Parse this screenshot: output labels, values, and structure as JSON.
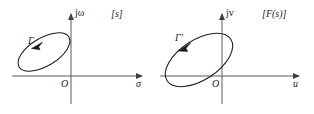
{
  "figure": {
    "background_color": "#ffffff",
    "line_color": "#1a1a1a",
    "axis_color": "#4a4a4a",
    "panels": [
      {
        "id": "s-plane",
        "plane_label": "[s]",
        "vertical_axis_label": "jω",
        "horizontal_axis_label": "σ",
        "origin_label": "O",
        "contour_label": "Γ",
        "contour_direction": "counterclockwise",
        "contour_shape": "tilted-ellipse",
        "contour_tilt_deg": -31,
        "contour_center_x": 44,
        "contour_center_y": 52,
        "contour_rx": 29,
        "contour_ry": 14,
        "axis_origin_x": 71,
        "axis_origin_y": 76,
        "h_axis_start_x": 12,
        "h_axis_end_x": 146,
        "v_axis_top_y": 11,
        "v_axis_bottom_y": 104
      },
      {
        "id": "F-plane",
        "plane_label": "[F(s)]",
        "vertical_axis_label": "jv",
        "horizontal_axis_label": "u",
        "origin_label": "O",
        "contour_label": "Γ'",
        "contour_direction": "counterclockwise",
        "contour_shape": "tilted-ellipse",
        "contour_tilt_deg": -33,
        "contour_center_x": 199,
        "contour_center_y": 60,
        "contour_rx": 38,
        "contour_ry": 20,
        "axis_origin_x": 222,
        "axis_origin_y": 76,
        "h_axis_start_x": 160,
        "h_axis_end_x": 303,
        "v_axis_top_y": 11,
        "v_axis_bottom_y": 104
      }
    ]
  }
}
